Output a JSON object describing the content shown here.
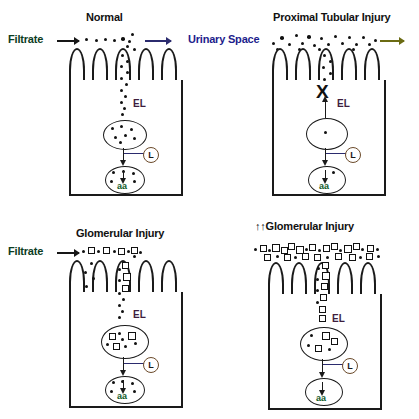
{
  "figure": {
    "kind": "biomedical-schematic"
  },
  "labels": {
    "filtrate": "Filtrate",
    "urinary_space": "Urinary Space",
    "el": "EL",
    "lysosome": "L",
    "amino_acids": "aa",
    "block_marker": "X",
    "double_up": "↑↑"
  },
  "panels": [
    {
      "id": "normal",
      "title": "Normal",
      "side_label": "Filtrate",
      "side_label_color": "#0b3d1e",
      "inlet_arrow": true,
      "outlet_arrow": true,
      "outlet_arrow_color": "#2b2b6e",
      "pathway_blocked": false,
      "particle_types": [
        "dot"
      ],
      "el_label": "EL",
      "lysosome_label": "L",
      "aa_label": "aa"
    },
    {
      "id": "proximal-tubular-injury",
      "title": "Proximal Tubular Injury",
      "side_label": "Urinary Space",
      "side_label_color": "#1d1d8c",
      "inlet_arrow": false,
      "outlet_arrow": true,
      "outlet_arrow_color": "#6b6b13",
      "pathway_blocked": true,
      "particle_types": [
        "dot"
      ],
      "el_label": "EL",
      "lysosome_label": "L",
      "aa_label": "aa"
    },
    {
      "id": "glomerular-injury",
      "title": "Glomerular Injury",
      "side_label": "Filtrate",
      "side_label_color": "#0b3d1e",
      "inlet_arrow": true,
      "outlet_arrow": false,
      "pathway_blocked": false,
      "particle_types": [
        "dot",
        "square"
      ],
      "el_label": "EL",
      "lysosome_label": "L",
      "aa_label": "aa"
    },
    {
      "id": "severe-glomerular-injury",
      "title": "Glomerular Injury",
      "title_prefix": "↑↑",
      "side_label": "",
      "inlet_arrow": false,
      "outlet_arrow": false,
      "pathway_blocked": false,
      "particle_types": [
        "square",
        "dot"
      ],
      "el_label": "EL",
      "lysosome_label": "L",
      "aa_label": "aa"
    }
  ],
  "colors": {
    "outline": "#1a1a1a",
    "el_text": "#3d1d3d",
    "aa_text": "#0f5a27",
    "lysosome_ring": "#6b4a2a",
    "filtrate_text": "#0b3d1e",
    "urinary_text": "#1d1d8c",
    "arrow_navy": "#2b2b6e",
    "arrow_olive": "#6b6b13",
    "particle_fill": "#111111",
    "background": "#ffffff"
  }
}
